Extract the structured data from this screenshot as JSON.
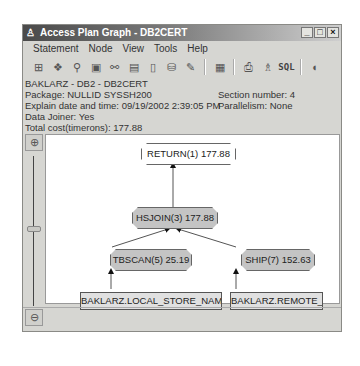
{
  "window": {
    "title": "Access Plan Graph - DB2CERT",
    "controls": [
      "minimize",
      "maximize",
      "close"
    ]
  },
  "menubar": {
    "items": [
      {
        "label": "Statement",
        "mnemonic": "S"
      },
      {
        "label": "Node",
        "mnemonic": "N"
      },
      {
        "label": "View",
        "mnemonic": "V"
      },
      {
        "label": "Tools",
        "mnemonic": "T"
      },
      {
        "label": "Help",
        "mnemonic": "H"
      }
    ]
  },
  "toolbar": {
    "icons": [
      "tree-view-icon",
      "statistics-icon",
      "search-node-icon",
      "details-icon",
      "operator-icon",
      "db-objects-icon",
      "document-icon",
      "table-stats-icon",
      "settings-icon",
      "window-icon",
      "print-icon",
      "network-icon"
    ],
    "sql_label": "SQL"
  },
  "info": {
    "line1": "BAKLARZ - DB2 - DB2CERT",
    "package": "Package: NULLID SYSSH200",
    "explain": "Explain date and time: 09/19/2002 2:39:05 PM",
    "joiner": "Data Joiner: Yes",
    "cost": "Total cost(timerons): 177.88",
    "section": "Section number: 4",
    "parallelism": "Parallelism: None"
  },
  "graph": {
    "nodes": [
      {
        "id": "return",
        "label": "RETURN(1) 177.88",
        "style": "white"
      },
      {
        "id": "hsjoin",
        "label": "HSJOIN(3) 177.88",
        "style": "gray"
      },
      {
        "id": "tbscan",
        "label": "TBSCAN(5) 25.19",
        "style": "gray"
      },
      {
        "id": "ship",
        "label": "SHIP(7) 152.63",
        "style": "gray"
      }
    ],
    "tables": [
      {
        "id": "local",
        "label": "BAKLARZ.LOCAL_STORE_NAMES"
      },
      {
        "id": "remote",
        "label": "BAKLARZ.REMOTE_S"
      }
    ]
  }
}
